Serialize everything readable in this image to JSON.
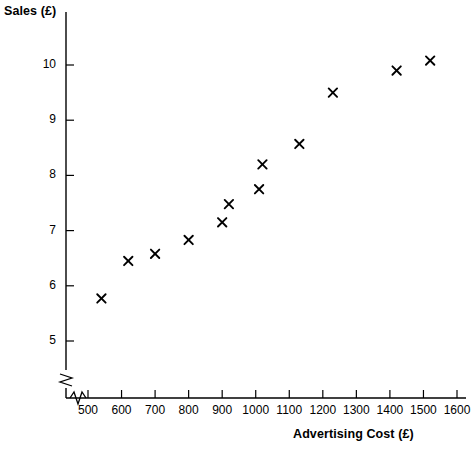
{
  "chart_data": {
    "type": "scatter",
    "title": "",
    "xlabel": "Advertising Cost (£)",
    "ylabel": "Sales (£)",
    "xlim": [
      450,
      1650
    ],
    "ylim": [
      4.6,
      10.6
    ],
    "xticks": [
      500,
      600,
      700,
      800,
      900,
      1000,
      1100,
      1200,
      1300,
      1400,
      1500,
      1600
    ],
    "yticks": [
      5,
      6,
      7,
      8,
      9,
      10
    ],
    "xtick_labels": [
      "500",
      "600",
      "700",
      "800",
      "900",
      "1000",
      "1100",
      "1200",
      "1300",
      "1400",
      "1500",
      "1600"
    ],
    "ytick_labels": [
      "5",
      "6",
      "7",
      "8",
      "9",
      "10"
    ],
    "grid": false,
    "legend": null,
    "marker": "x-cross",
    "axis_break_x": true,
    "axis_break_y": true,
    "points": [
      {
        "x": 540,
        "y": 5.77
      },
      {
        "x": 620,
        "y": 6.45
      },
      {
        "x": 700,
        "y": 6.58
      },
      {
        "x": 800,
        "y": 6.83
      },
      {
        "x": 900,
        "y": 7.15
      },
      {
        "x": 920,
        "y": 7.48
      },
      {
        "x": 1010,
        "y": 7.75
      },
      {
        "x": 1020,
        "y": 8.2
      },
      {
        "x": 1130,
        "y": 8.57
      },
      {
        "x": 1230,
        "y": 9.5
      },
      {
        "x": 1420,
        "y": 9.9
      },
      {
        "x": 1520,
        "y": 10.08
      }
    ],
    "colors": {
      "axis": "#000000",
      "marker": "#000000",
      "background": "#ffffff"
    }
  }
}
